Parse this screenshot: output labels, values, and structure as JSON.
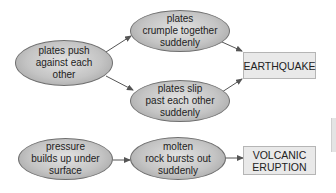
{
  "diagram": {
    "type": "flowchart",
    "earthquake_chain": {
      "cause": "plates push\nagainst each\nother",
      "branch_1": "plates\ncrumple together\nsuddenly",
      "branch_2": "plates slip\npast each other\nsuddenly",
      "result": "EARTHQUAKE"
    },
    "volcano_chain": {
      "cause": "pressure\nbuilds up under\nsurface",
      "step": "molten\nrock bursts out\nsuddenly",
      "result": "VOLCANIC\nERUPTION"
    },
    "edges": [
      {
        "from": "plates push against each other",
        "to": "plates crumple together suddenly"
      },
      {
        "from": "plates push against each other",
        "to": "plates slip past each other suddenly"
      },
      {
        "from": "plates crumple together suddenly",
        "to": "EARTHQUAKE"
      },
      {
        "from": "plates slip past each other suddenly",
        "to": "EARTHQUAKE"
      },
      {
        "from": "pressure builds up under surface",
        "to": "molten rock bursts out suddenly"
      },
      {
        "from": "molten rock bursts out suddenly",
        "to": "VOLCANIC ERUPTION"
      }
    ],
    "colors": {
      "ellipse_fill": "#c4c4c4",
      "ellipse_border": "#6f6f6f",
      "box_fill": "#e9e9e9",
      "box_border": "#b5b5b5",
      "arrow": "#555555"
    }
  }
}
